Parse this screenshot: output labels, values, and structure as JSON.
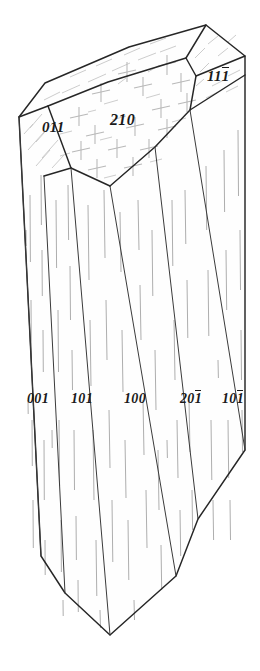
{
  "figure": {
    "kind": "crystal-form-diagram",
    "background_color": "#ffffff",
    "outline_color": "#262626",
    "striation_color": "#aeaeae",
    "label_color": "#1a1a1a"
  },
  "labels": [
    {
      "id": "face-011",
      "text": "011",
      "digits": [
        "0",
        "1",
        "1"
      ],
      "bars": [
        false,
        false,
        false
      ],
      "x": 42,
      "y": 120,
      "size": 15
    },
    {
      "id": "face-210",
      "text": "210",
      "digits": [
        "2",
        "1",
        "0"
      ],
      "bars": [
        false,
        false,
        false
      ],
      "x": 110,
      "y": 112,
      "size": 16
    },
    {
      "id": "face-111",
      "text": "111",
      "digits": [
        "1",
        "1",
        "1"
      ],
      "bars": [
        false,
        false,
        true
      ],
      "x": 207,
      "y": 69,
      "size": 15
    },
    {
      "id": "face-001",
      "text": "001",
      "digits": [
        "0",
        "0",
        "1"
      ],
      "bars": [
        false,
        false,
        false
      ],
      "x": 27,
      "y": 392,
      "size": 14
    },
    {
      "id": "face-101a",
      "text": "101",
      "digits": [
        "1",
        "0",
        "1"
      ],
      "bars": [
        false,
        false,
        false
      ],
      "x": 71,
      "y": 392,
      "size": 14
    },
    {
      "id": "face-100",
      "text": "100",
      "digits": [
        "1",
        "0",
        "0"
      ],
      "bars": [
        false,
        false,
        false
      ],
      "x": 124,
      "y": 392,
      "size": 14
    },
    {
      "id": "face-201",
      "text": "201",
      "digits": [
        "2",
        "0",
        "1"
      ],
      "bars": [
        false,
        false,
        true
      ],
      "x": 180,
      "y": 392,
      "size": 14
    },
    {
      "id": "face-101b",
      "text": "101",
      "digits": [
        "1",
        "0",
        "1"
      ],
      "bars": [
        false,
        false,
        true
      ],
      "x": 222,
      "y": 392,
      "size": 14
    }
  ]
}
